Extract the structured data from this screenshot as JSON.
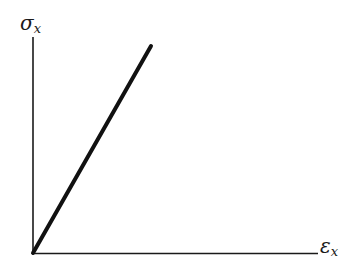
{
  "diagram": {
    "type": "stress-strain",
    "y_axis_label": "σ",
    "y_axis_sub": "x",
    "x_axis_label": "ε",
    "x_axis_sub": "x",
    "line": {
      "from": [
        33,
        253
      ],
      "to": [
        151,
        46
      ],
      "description": "linear elastic relation"
    },
    "colors": {
      "ink": "#1a1a1a",
      "background": "#ffffff"
    }
  }
}
